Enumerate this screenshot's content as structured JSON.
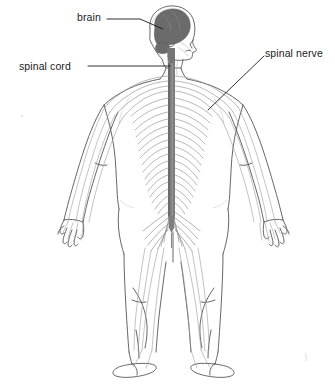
{
  "figure": {
    "background_color": "#ffffff"
  },
  "labels": {
    "brain": "brain",
    "spinal_cord": "spinal cord",
    "spinal_nerve": "spinal nerve"
  },
  "colors": {
    "brain_fill": "#6b6b6b",
    "spinal_cord_fill": "#7d7d7d",
    "nerve_line": "#9a9a9a",
    "body_outline": "#555555",
    "leader_line": "#1a1a1a",
    "text": "#1a1a1a",
    "background": "#ffffff"
  },
  "anatomy_parts": {
    "head": "head-profile-facing-right",
    "brain": "brain-mass-shaded",
    "spinal_cord": "vertical-spinal-cord-column",
    "spinal_nerves": "bilateral-segmental-nerve-branches",
    "brachial_plexus": "shoulder-nerve-fan",
    "cauda_equina": "lumbar-nerve-bundle",
    "arms": "both-arms-outstretched-with-hands",
    "legs": "both-legs-standing",
    "feet": "both-feet-posterior-view"
  },
  "leader_lines": {
    "brain": "horizontal-then-diagonal-down-right",
    "spinal_cord": "horizontal-right",
    "spinal_nerve": "diagonal-down-left"
  }
}
